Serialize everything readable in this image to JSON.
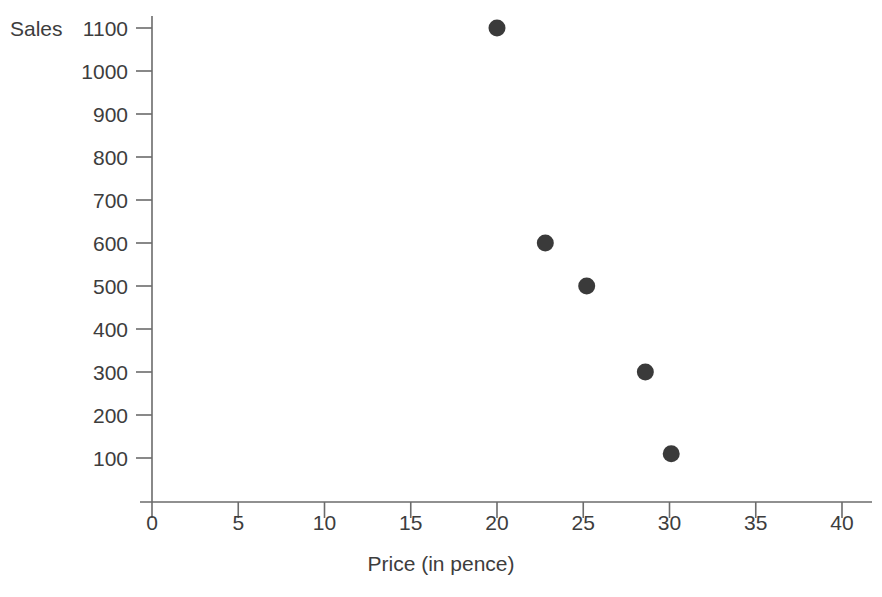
{
  "chart_data": {
    "type": "scatter",
    "title": "",
    "xlabel": "Price (in pence)",
    "ylabel": "Sales",
    "xlim": [
      0,
      40
    ],
    "ylim": [
      0,
      1100
    ],
    "grid": false,
    "legend": "none",
    "x_ticks": [
      0,
      5,
      10,
      15,
      20,
      25,
      30,
      35,
      40
    ],
    "x_tick_labels": [
      "0",
      "5",
      "10",
      "15",
      "20",
      "25",
      "30",
      "35",
      "40"
    ],
    "y_ticks": [
      100,
      200,
      300,
      400,
      500,
      600,
      700,
      800,
      900,
      1000,
      1100
    ],
    "y_tick_labels": [
      "100",
      "200",
      "300",
      "400",
      "500",
      "600",
      "700",
      "800",
      "900",
      "1000",
      "1100"
    ],
    "marker": "filled-circle",
    "marker_color": "#3a3a3a",
    "axis_color": "#6b6b6b",
    "points": [
      {
        "x": 20.0,
        "y": 1100
      },
      {
        "x": 22.8,
        "y": 600
      },
      {
        "x": 25.2,
        "y": 500
      },
      {
        "x": 28.6,
        "y": 300
      },
      {
        "x": 30.1,
        "y": 110
      }
    ]
  },
  "axes": {
    "y_title": "Sales",
    "x_title": "Price (in pence)"
  }
}
